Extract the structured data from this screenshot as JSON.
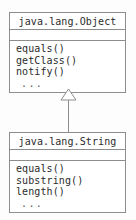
{
  "diagram": {
    "type": "uml-class-diagram",
    "background_color": "#fdfdfd",
    "line_color": "#8d8d8d",
    "text_color": "#2b2b2b",
    "box_fill": "#ffffff",
    "classes": [
      {
        "role": "superclass",
        "name": "java.lang.Object",
        "attributes": [],
        "operations": [
          "equals()",
          "getClass()",
          "notify()"
        ],
        "ellipsis": "..."
      },
      {
        "role": "subclass",
        "name": "java.lang.String",
        "attributes": [],
        "operations": [
          "equals()",
          "substring()",
          "length()"
        ],
        "ellipsis": "..."
      }
    ],
    "relationship": {
      "kind": "generalization",
      "from": "java.lang.String",
      "to": "java.lang.Object",
      "arrowhead": "hollow-triangle"
    }
  }
}
